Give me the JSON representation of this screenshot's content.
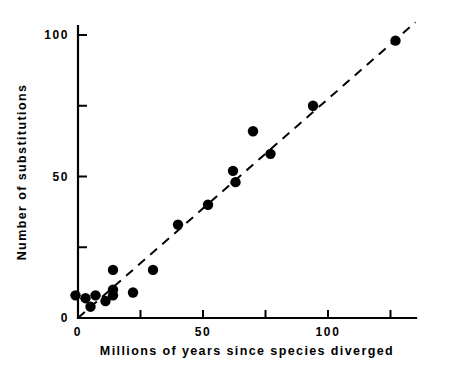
{
  "chart_data": {
    "type": "scatter",
    "title": "",
    "xlabel": "Millions of years since species diverged",
    "ylabel": "Number of substitutions",
    "xlim": [
      -5,
      135
    ],
    "ylim": [
      -3,
      107
    ],
    "grid": false,
    "legend": "none",
    "x_ticks": [
      0,
      25,
      50,
      75,
      100,
      125
    ],
    "x_tick_labels": [
      "0",
      "",
      "50",
      "",
      "100",
      ""
    ],
    "y_ticks": [
      0,
      25,
      50,
      75,
      100
    ],
    "y_tick_labels": [
      "0",
      "",
      "50",
      "",
      "100"
    ],
    "point_color": "#000000",
    "line_color": "#000000",
    "line_style": "dashed",
    "points": [
      {
        "x": -1,
        "y": 8
      },
      {
        "x": 3,
        "y": 7
      },
      {
        "x": 5,
        "y": 4
      },
      {
        "x": 7,
        "y": 8
      },
      {
        "x": 11,
        "y": 6
      },
      {
        "x": 14,
        "y": 8
      },
      {
        "x": 14,
        "y": 17
      },
      {
        "x": 14,
        "y": 10
      },
      {
        "x": 22,
        "y": 9
      },
      {
        "x": 30,
        "y": 17
      },
      {
        "x": 40,
        "y": 33
      },
      {
        "x": 52,
        "y": 40
      },
      {
        "x": 62,
        "y": 52
      },
      {
        "x": 63,
        "y": 48
      },
      {
        "x": 70,
        "y": 66
      },
      {
        "x": 77,
        "y": 58
      },
      {
        "x": 94,
        "y": 75
      },
      {
        "x": 127,
        "y": 98
      }
    ],
    "fit_line": {
      "x_start": 0,
      "y_start": 0,
      "x_end": 135,
      "y_end": 104.5
    }
  },
  "axes": {
    "x_title": "Millions of years since species diverged",
    "y_title": "Number of substitutions"
  }
}
